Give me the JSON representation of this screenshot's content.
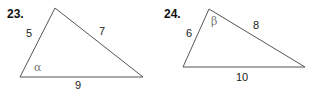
{
  "problems": [
    {
      "number": "23.",
      "vertices": [
        [
          55,
          8
        ],
        [
          20,
          77
        ],
        [
          143,
          77
        ]
      ],
      "sides": {
        "left": "5",
        "right": "7",
        "bottom": "9"
      },
      "angle": {
        "symbol": "α",
        "at": "bottom-left"
      }
    },
    {
      "number": "24.",
      "vertices": [
        [
          209,
          9
        ],
        [
          183,
          67
        ],
        [
          305,
          67
        ]
      ],
      "sides": {
        "left": "6",
        "right": "8",
        "bottom": "10"
      },
      "angle": {
        "symbol": "β",
        "at": "top"
      }
    }
  ],
  "colors": {
    "stroke": "#555555",
    "text": "#222222",
    "angle_label": "#777777"
  }
}
